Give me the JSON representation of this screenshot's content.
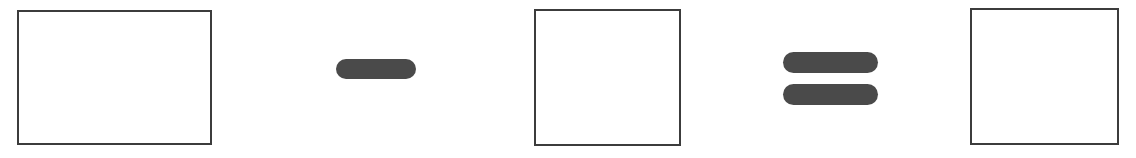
{
  "page": {
    "background_color": "#ffffff",
    "width": 1136,
    "height": 158
  },
  "equation": {
    "expression": "□ − □ = □",
    "operator_color": "#4a4a4a",
    "box_border_color": "#3c3c3c",
    "box_fill_color": "#ffffff",
    "terms": [
      {
        "id": "minuend",
        "role": "first-operand",
        "kind": "answer-box",
        "value": "",
        "placeholder": "",
        "label": "First number box"
      },
      {
        "id": "subtrahend",
        "role": "second-operand",
        "kind": "answer-box",
        "value": "",
        "placeholder": "",
        "label": "Second number box"
      },
      {
        "id": "difference",
        "role": "result",
        "kind": "answer-box",
        "value": "",
        "placeholder": "",
        "label": "Answer box"
      }
    ],
    "operators": [
      {
        "id": "minus",
        "symbol": "−",
        "name": "minus-sign",
        "bars": 1
      },
      {
        "id": "equals",
        "symbol": "=",
        "name": "equals-sign",
        "bars": 2
      }
    ]
  }
}
